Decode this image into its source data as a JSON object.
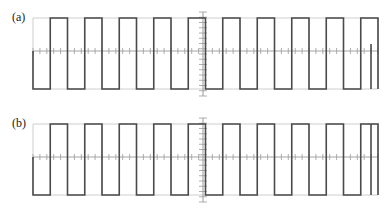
{
  "figure": {
    "background": "#ffffff",
    "width": 386,
    "height": 212,
    "grid_color": "#c8c8c8",
    "axis_color": "#9a9a9a",
    "trace_color": "#4a4a4a",
    "label_color": "#1b1b1b"
  },
  "panels": [
    {
      "id": "a",
      "label": "(a)",
      "plot": {
        "x0": 33,
        "x1": 378,
        "y_top": 18,
        "y_center": 51,
        "y_bottom": 89,
        "v_divisions": 10,
        "h_divisions": 2,
        "center_axis_x": 203,
        "center_axis_top": 12,
        "center_axis_bottom": 96,
        "minor_ticks_per_division_x": 5,
        "minor_ticks_on_v_axis": 16,
        "minor_tick_len_x": 3,
        "minor_tick_len_y": 4
      },
      "waveform": {
        "type": "square",
        "duty_cycle": 0.5,
        "period_px": 34.5,
        "cycles": 10,
        "high_y": 18,
        "low_y": 89,
        "lead_in": {
          "from_y": 51,
          "to_y": 89,
          "x": 33
        },
        "tail": {
          "type": "rising-edge",
          "x": 371,
          "from_y": 89,
          "to_y": 44
        },
        "stroke_width": 1.6,
        "start_phase": "low"
      }
    },
    {
      "id": "b",
      "label": "(b)",
      "plot": {
        "x0": 33,
        "x1": 378,
        "y_top": 18,
        "y_center": 51,
        "y_bottom": 89,
        "v_divisions": 10,
        "h_divisions": 2,
        "center_axis_x": 203,
        "center_axis_top": 12,
        "center_axis_bottom": 96,
        "minor_ticks_per_division_x": 5,
        "minor_ticks_on_v_axis": 16,
        "minor_tick_len_x": 3,
        "minor_tick_len_y": 4
      },
      "waveform": {
        "type": "square",
        "duty_cycle": 0.5,
        "period_px": 34.5,
        "cycles": 10,
        "high_y": 18,
        "low_y": 89,
        "lead_in": {
          "from_y": 51,
          "to_y": 89,
          "x": 33
        },
        "tail": {
          "type": "falling-edge",
          "x": 371,
          "from_y": 18,
          "to_y": 89
        },
        "stroke_width": 1.6,
        "start_phase": "low"
      }
    }
  ],
  "chart_data": {
    "type": "line",
    "title": "",
    "xlabel": "",
    "ylabel": "",
    "subplots": [
      {
        "name": "(a)",
        "signal": "square wave",
        "amplitude_levels": [
          0,
          1
        ],
        "duty_cycle_percent": 50,
        "cycles_shown": 10,
        "description": "Square wave trace, 10 periods across 10 horizontal divisions, 50% duty cycle, high level at top gridline, low level at bottom gridline, trace begins on a falling stub at the left margin and ends with a partial rising edge at the right margin.",
        "grid": true,
        "x": [
          0,
          0.5,
          1,
          1.5,
          2,
          2.5,
          3,
          3.5,
          4,
          4.5,
          5,
          5.5,
          6,
          6.5,
          7,
          7.5,
          8,
          8.5,
          9,
          9.5,
          10
        ],
        "values": [
          1,
          1,
          0,
          0,
          1,
          1,
          0,
          0,
          1,
          1,
          0,
          0,
          1,
          1,
          0,
          0,
          1,
          1,
          0,
          0,
          1
        ]
      },
      {
        "name": "(b)",
        "signal": "square wave",
        "amplitude_levels": [
          0,
          1
        ],
        "duty_cycle_percent": 50,
        "cycles_shown": 10,
        "description": "Square wave trace, 10 periods across 10 horizontal divisions, 50% duty cycle, high level at top gridline, low level at bottom gridline, trace begins on a falling stub at the left margin and ends with a falling edge at the right margin.",
        "grid": true,
        "x": [
          0,
          0.5,
          1,
          1.5,
          2,
          2.5,
          3,
          3.5,
          4,
          4.5,
          5,
          5.5,
          6,
          6.5,
          7,
          7.5,
          8,
          8.5,
          9,
          9.5,
          10
        ],
        "values": [
          1,
          1,
          0,
          0,
          1,
          1,
          0,
          0,
          1,
          1,
          0,
          0,
          1,
          1,
          0,
          0,
          1,
          1,
          0,
          0,
          1
        ]
      }
    ],
    "axis_ranges": {
      "x": [
        0,
        10
      ],
      "y": [
        -1,
        1
      ]
    },
    "legend": "none"
  }
}
